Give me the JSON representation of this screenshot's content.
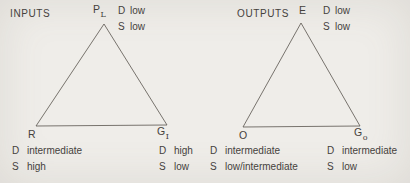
{
  "figure": {
    "background": "#efede9",
    "ink": "#45413c",
    "line_color": "#5a564f"
  },
  "diagrams": [
    {
      "title": "INPUTS",
      "apex": {
        "label": "P",
        "sub": "L",
        "attrs": [
          {
            "key": "D",
            "value": "low"
          },
          {
            "key": "S",
            "value": "low"
          }
        ]
      },
      "bottom_left": {
        "label": "R",
        "sub": "",
        "attrs": [
          {
            "key": "D",
            "value": "intermediate"
          },
          {
            "key": "S",
            "value": "high"
          }
        ]
      },
      "bottom_right": {
        "label": "G",
        "sub": "I",
        "attrs": [
          {
            "key": "D",
            "value": "high"
          },
          {
            "key": "S",
            "value": "low"
          }
        ]
      }
    },
    {
      "title": "OUTPUTS",
      "apex": {
        "label": "E",
        "sub": "",
        "attrs": [
          {
            "key": "D",
            "value": "low"
          },
          {
            "key": "S",
            "value": "low"
          }
        ]
      },
      "bottom_left": {
        "label": "O",
        "sub": "",
        "attrs": [
          {
            "key": "D",
            "value": "intermediate"
          },
          {
            "key": "S",
            "value": "low/intermediate"
          }
        ]
      },
      "bottom_right": {
        "label": "G",
        "sub": "o",
        "attrs": [
          {
            "key": "D",
            "value": "intermediate"
          },
          {
            "key": "S",
            "value": "low"
          }
        ]
      }
    }
  ]
}
